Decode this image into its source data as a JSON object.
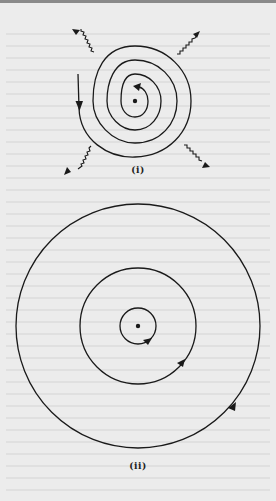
{
  "figure": {
    "type": "atomic-model-comparison",
    "panels": [
      {
        "label": "(i)",
        "description": "Electron spiralling into nucleus while radiating energy",
        "nucleus": {
          "cx": 135,
          "cy": 101
        },
        "spiral_turns": 4,
        "radiation_arrows": [
          {
            "direction": "up-left"
          },
          {
            "direction": "up-right"
          },
          {
            "direction": "down-left"
          },
          {
            "direction": "down-right"
          }
        ]
      },
      {
        "label": "(ii)",
        "description": "Stable concentric orbits around nucleus",
        "nucleus": {
          "cx": 138,
          "cy": 326
        },
        "orbits": [
          {
            "r": 18
          },
          {
            "r": 58
          },
          {
            "r": 122
          }
        ]
      }
    ]
  },
  "colors": {
    "background": "#ececec",
    "ink": "#1a1a1a"
  }
}
